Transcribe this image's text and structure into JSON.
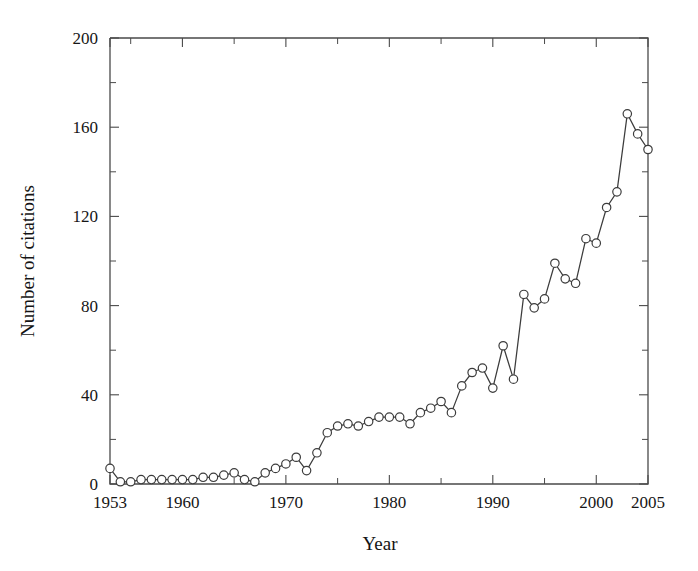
{
  "chart_data": {
    "type": "line",
    "title": "",
    "xlabel": "Year",
    "ylabel": "Number of citations",
    "xlim": [
      1953,
      2005
    ],
    "ylim": [
      0,
      200
    ],
    "grid": false,
    "legend": null,
    "marker": "open-circle",
    "x_ticks": [
      1953,
      1960,
      1970,
      1980,
      1990,
      2000,
      2005
    ],
    "x_tick_labels": [
      "1953",
      "1960",
      "1970",
      "1980",
      "1990",
      "2000",
      "2005"
    ],
    "x_minor_ticks": [
      1955,
      1965,
      1975,
      1985,
      1995
    ],
    "y_ticks": [
      0,
      40,
      80,
      120,
      160,
      200
    ],
    "y_tick_labels": [
      "0",
      "40",
      "80",
      "120",
      "160",
      "200"
    ],
    "y_minor_ticks": [
      20,
      60,
      100,
      140,
      180
    ],
    "x": [
      1953,
      1954,
      1955,
      1956,
      1957,
      1958,
      1959,
      1960,
      1961,
      1962,
      1963,
      1964,
      1965,
      1966,
      1967,
      1968,
      1969,
      1970,
      1971,
      1972,
      1973,
      1974,
      1975,
      1976,
      1977,
      1978,
      1979,
      1980,
      1981,
      1982,
      1983,
      1984,
      1985,
      1986,
      1987,
      1988,
      1989,
      1990,
      1991,
      1992,
      1993,
      1994,
      1995,
      1996,
      1997,
      1998,
      1999,
      2000,
      2001,
      2002,
      2003,
      2004,
      2005
    ],
    "values": [
      7,
      1,
      1,
      2,
      2,
      2,
      2,
      2,
      2,
      3,
      3,
      4,
      5,
      2,
      1,
      5,
      7,
      9,
      12,
      6,
      14,
      23,
      26,
      27,
      26,
      28,
      30,
      30,
      30,
      27,
      32,
      34,
      37,
      32,
      44,
      50,
      52,
      43,
      62,
      47,
      85,
      79,
      83,
      99,
      92,
      90,
      110,
      108,
      124,
      131,
      166,
      157,
      150
    ],
    "series_name": "Number of citations",
    "line_color": "#3c3c3c",
    "marker_fill": "#ffffff",
    "background": "#ffffff"
  },
  "axes": {
    "y_title": "Number of citations",
    "x_title": "Year"
  }
}
